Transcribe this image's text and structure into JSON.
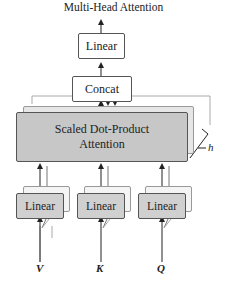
{
  "diagram": {
    "title": "Multi-Head Attention",
    "nodes": {
      "output_linear": "Linear",
      "concat": "Concat",
      "attention": "Scaled Dot-Product Attention",
      "attention_line1": "Scaled Dot-Product",
      "attention_line2": "Attention",
      "linear_v": "Linear",
      "linear_k": "Linear",
      "linear_q": "Linear"
    },
    "inputs": [
      "V",
      "K",
      "Q"
    ],
    "heads_label": "h"
  },
  "colors": {
    "attention_fill": "#c7c7c7",
    "linear_fill": "#d0d0d0",
    "stroke": "#555555"
  }
}
